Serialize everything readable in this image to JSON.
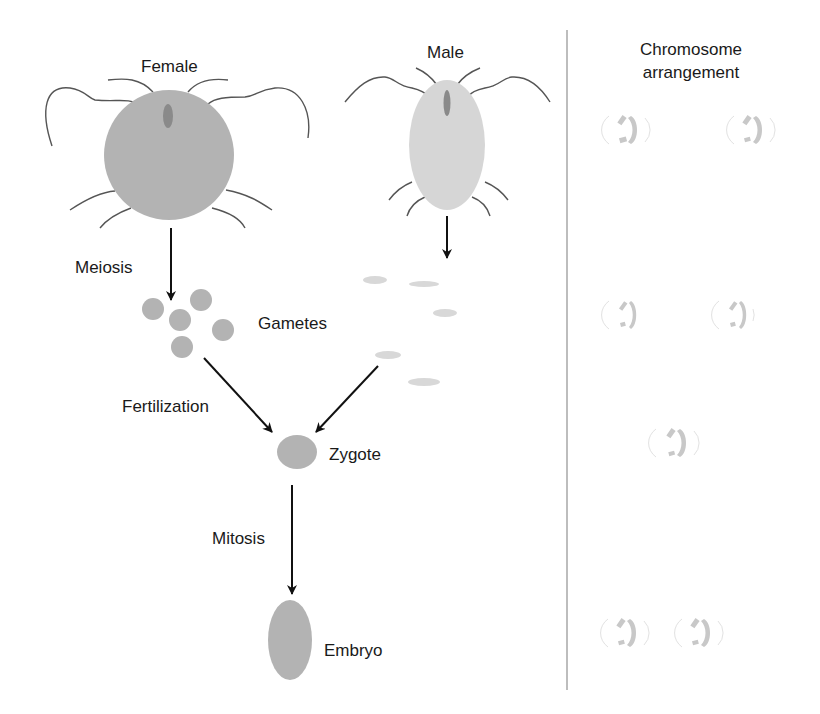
{
  "diagram": {
    "colors": {
      "female_body": "#b3b3b3",
      "male_body": "#d6d6d6",
      "eye": "#8a8a8a",
      "female_gamete": "#b3b3b3",
      "male_gamete": "#d8d8d8",
      "zygote": "#b3b3b3",
      "embryo": "#b3b3b3",
      "arrow": "#111111",
      "divider": "#bdbdbd",
      "chromosome": "#c8c8c8",
      "text": "#1a1a1a"
    },
    "organisms": {
      "female": {
        "label": "Female"
      },
      "male": {
        "label": "Male"
      }
    },
    "processes": {
      "meiosis": "Meiosis",
      "fertilization": "Fertilization",
      "mitosis": "Mitosis"
    },
    "stages": {
      "gametes": "Gametes",
      "zygote": "Zygote",
      "embryo": "Embryo"
    },
    "chromosome_panel": {
      "heading": "Chromosome arrangement",
      "rows": [
        {
          "stage": "parents",
          "sets": 2,
          "ploidy": "diploid"
        },
        {
          "stage": "gametes",
          "sets": 2,
          "ploidy": "haploid"
        },
        {
          "stage": "zygote",
          "sets": 1,
          "ploidy": "diploid"
        },
        {
          "stage": "embryo",
          "sets": 2,
          "ploidy": "diploid"
        }
      ]
    }
  }
}
